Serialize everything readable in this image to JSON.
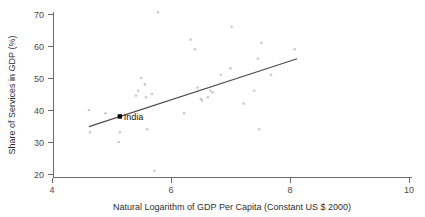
{
  "chart_data": {
    "type": "scatter",
    "title": "",
    "subtitle": "",
    "xlabel": "Natural Logarithm of GDP Per Capita (Constant US $ 2000)",
    "ylabel": "Share of Services in GDP (%)",
    "xlim": [
      4,
      10
    ],
    "ylim": [
      18,
      72
    ],
    "xticks": [
      4,
      6,
      8,
      10
    ],
    "xticklabels": [
      "4",
      "6",
      "8",
      "10"
    ],
    "yticks": [
      20,
      30,
      40,
      50,
      60,
      70
    ],
    "yticklabels": [
      "20",
      "30",
      "40",
      "50",
      "60",
      "70"
    ],
    "grid": false,
    "legend": null,
    "legend_position": "none",
    "marker_color": "#c9c9c9",
    "axis_color": "#6b6b6b",
    "series": [
      {
        "name": "Countries",
        "marker": "dot",
        "points": [
          [
            4.62,
            40.0
          ],
          [
            4.64,
            33.0
          ],
          [
            4.9,
            39.0
          ],
          [
            5.14,
            33.0
          ],
          [
            5.12,
            30.0
          ],
          [
            5.41,
            44.5
          ],
          [
            5.45,
            46.0
          ],
          [
            5.5,
            50.0
          ],
          [
            5.56,
            48.0
          ],
          [
            5.58,
            44.0
          ],
          [
            5.6,
            34.0
          ],
          [
            5.68,
            45.0
          ],
          [
            5.72,
            21.0
          ],
          [
            5.78,
            70.5
          ],
          [
            6.22,
            39.0
          ],
          [
            6.33,
            62.0
          ],
          [
            6.4,
            59.0
          ],
          [
            6.45,
            47.0
          ],
          [
            6.5,
            43.5
          ],
          [
            6.52,
            43.0
          ],
          [
            6.62,
            44.0
          ],
          [
            6.66,
            46.0
          ],
          [
            6.7,
            45.5
          ],
          [
            6.84,
            51.0
          ],
          [
            7.0,
            53.0
          ],
          [
            7.02,
            66.0
          ],
          [
            7.22,
            42.0
          ],
          [
            7.4,
            46.0
          ],
          [
            7.46,
            56.0
          ],
          [
            7.48,
            34.0
          ],
          [
            7.52,
            61.0
          ],
          [
            7.68,
            51.0
          ],
          [
            8.08,
            59.0
          ]
        ]
      }
    ],
    "fit_line": {
      "name": "linear-fit",
      "x_start": 4.62,
      "y_start": 34.8,
      "x_end": 8.12,
      "y_end": 56.0,
      "color": "#4a4a4a"
    },
    "annotations": [
      {
        "name": "india",
        "label": "India",
        "x": 5.14,
        "y": 38.0,
        "marker": "filled-square",
        "color": "#000000"
      }
    ]
  }
}
